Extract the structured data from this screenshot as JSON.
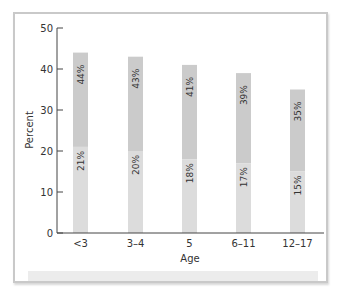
{
  "chart_data": {
    "type": "bar",
    "stacked": true,
    "title": "",
    "xlabel": "Age",
    "ylabel": "Percent",
    "ylim": [
      0,
      50
    ],
    "yticks": [
      0,
      10,
      20,
      30,
      40,
      50
    ],
    "categories": [
      "<3",
      "3–4",
      "5",
      "6–11",
      "12–17"
    ],
    "series": [
      {
        "name": "lower segment",
        "values": [
          21,
          20,
          18,
          17,
          15
        ],
        "labels": [
          "21%",
          "20%",
          "18%",
          "17%",
          "15%"
        ],
        "color": "#dcdcdc"
      },
      {
        "name": "total",
        "values": [
          44,
          43,
          41,
          39,
          35
        ],
        "labels": [
          "44%",
          "43%",
          "41%",
          "39%",
          "35%"
        ],
        "color": "#cbcbcb"
      }
    ],
    "grid": false,
    "legend": "none"
  }
}
